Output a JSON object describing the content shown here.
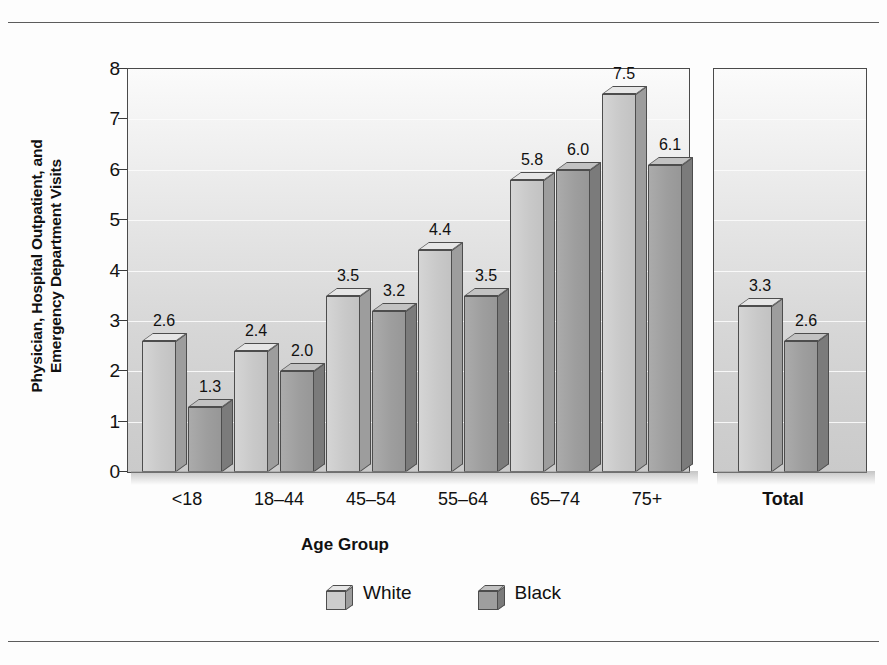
{
  "chart_data": {
    "type": "bar",
    "title": "",
    "xlabel": "Age Group",
    "ylabel_line1": "Physician, Hospital Outpatient, and",
    "ylabel_line2": "Emergency Department Visits",
    "categories": [
      "<18",
      "18–44",
      "45–54",
      "55–64",
      "65–74",
      "75+"
    ],
    "extra_category": "Total",
    "series": [
      {
        "name": "White",
        "values": [
          2.6,
          2.4,
          3.5,
          4.4,
          5.8,
          7.5
        ],
        "total": 3.3,
        "color": "#c9c9c9"
      },
      {
        "name": "Black",
        "values": [
          1.3,
          2.0,
          3.2,
          3.5,
          6.0,
          6.1
        ],
        "total": 2.6,
        "color": "#9e9e9e"
      }
    ],
    "value_labels": {
      "White": [
        "2.6",
        "2.4",
        "3.5",
        "4.4",
        "5.8",
        "7.5"
      ],
      "Black": [
        "1.3",
        "2.0",
        "3.2",
        "3.5",
        "6.0",
        "6.1"
      ],
      "White_total": "3.3",
      "Black_total": "2.6"
    },
    "ylim": [
      0,
      8
    ],
    "yticks": [
      "0",
      "1",
      "2",
      "3",
      "4",
      "5",
      "6",
      "7",
      "8"
    ],
    "grid": true,
    "legend_position": "bottom",
    "legend": [
      "White",
      "Black"
    ]
  }
}
